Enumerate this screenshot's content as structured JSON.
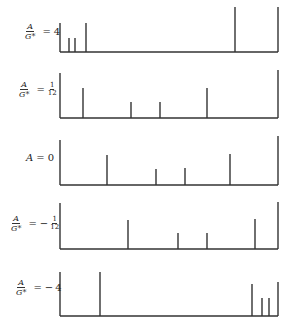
{
  "stroke_color": "#333333",
  "panels": [
    {
      "label": {
        "lhs_num": "A",
        "lhs_den": "G*",
        "eq": "=",
        "sign": "",
        "value": "4",
        "value_num": "",
        "value_den": ""
      },
      "label_pos": {
        "x": 24,
        "y": 30
      },
      "axis": {
        "x": 60,
        "top": 23,
        "bottom": 52,
        "right": 278,
        "right_top": 7
      },
      "lines": [
        {
          "x": 69,
          "top": 38
        },
        {
          "x": 75,
          "top": 38
        },
        {
          "x": 86,
          "top": 23
        },
        {
          "x": 235,
          "top": 7
        }
      ]
    },
    {
      "label": {
        "lhs_num": "A",
        "lhs_den": "G*",
        "eq": "=",
        "sign": "",
        "value": "",
        "value_num": "1",
        "value_den": "12"
      },
      "label_pos": {
        "x": 18,
        "y": 88
      },
      "axis": {
        "x": 60,
        "top": 73,
        "bottom": 118,
        "right": 278,
        "right_top": 70
      },
      "lines": [
        {
          "x": 83,
          "top": 88
        },
        {
          "x": 131,
          "top": 102
        },
        {
          "x": 160,
          "top": 102
        },
        {
          "x": 207,
          "top": 88
        }
      ]
    },
    {
      "label": {
        "lhs_num": "",
        "lhs_den": "",
        "eq": "=",
        "sign": "",
        "value": "0",
        "value_num": "",
        "value_den": "",
        "plain_lhs": "A"
      },
      "label_pos": {
        "x": 26,
        "y": 156
      },
      "axis": {
        "x": 60,
        "top": 140,
        "bottom": 185,
        "right": 278,
        "right_top": 136
      },
      "lines": [
        {
          "x": 107,
          "top": 155
        },
        {
          "x": 156,
          "top": 169
        },
        {
          "x": 185,
          "top": 168
        },
        {
          "x": 230,
          "top": 154
        }
      ]
    },
    {
      "label": {
        "lhs_num": "A",
        "lhs_den": "G*",
        "eq": "=",
        "sign": "−",
        "value": "",
        "value_num": "1",
        "value_den": "12"
      },
      "label_pos": {
        "x": 10,
        "y": 222
      },
      "axis": {
        "x": 60,
        "top": 203,
        "bottom": 249,
        "right": 278,
        "right_top": 202
      },
      "lines": [
        {
          "x": 128,
          "top": 220
        },
        {
          "x": 178,
          "top": 233
        },
        {
          "x": 207,
          "top": 233
        },
        {
          "x": 255,
          "top": 219
        }
      ]
    },
    {
      "label": {
        "lhs_num": "A",
        "lhs_den": "G*",
        "eq": "=",
        "sign": "−",
        "value": "4",
        "value_num": "",
        "value_den": ""
      },
      "label_pos": {
        "x": 15,
        "y": 286
      },
      "axis": {
        "x": 60,
        "top": 272,
        "bottom": 316,
        "right": 278,
        "right_top": 282
      },
      "lines": [
        {
          "x": 100,
          "top": 272
        },
        {
          "x": 252,
          "top": 284
        },
        {
          "x": 262,
          "top": 298
        },
        {
          "x": 269,
          "top": 298
        }
      ]
    }
  ]
}
